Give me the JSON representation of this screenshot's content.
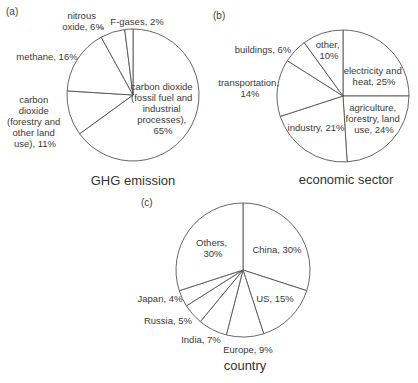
{
  "chart_data": [
    {
      "type": "pie",
      "panel": "(a)",
      "title": "GHG emission",
      "start_angle": "12 o'clock, clockwise",
      "slices": [
        {
          "label": "carbon dioxide (fossil fuel and industrial processes)",
          "value": 65
        },
        {
          "label": "carbon dioxide (forestry and other land use)",
          "value": 11
        },
        {
          "label": "methane",
          "value": 16
        },
        {
          "label": "nitrous oxide",
          "value": 6
        },
        {
          "label": "F-gases",
          "value": 2
        }
      ]
    },
    {
      "type": "pie",
      "panel": "(b)",
      "title": "economic sector",
      "start_angle": "12 o'clock, clockwise",
      "slices": [
        {
          "label": "electricity and heat",
          "value": 25
        },
        {
          "label": "agriculture, forestry, land use",
          "value": 24
        },
        {
          "label": "industry",
          "value": 21
        },
        {
          "label": "transportation",
          "value": 14
        },
        {
          "label": "buildings",
          "value": 6
        },
        {
          "label": "other",
          "value": 10
        }
      ]
    },
    {
      "type": "pie",
      "panel": "(c)",
      "title": "country",
      "start_angle": "12 o'clock, clockwise",
      "slices": [
        {
          "label": "China",
          "value": 30
        },
        {
          "label": "US",
          "value": 15
        },
        {
          "label": "Europe",
          "value": 9
        },
        {
          "label": "India",
          "value": 7
        },
        {
          "label": "Russia",
          "value": 5
        },
        {
          "label": "Japan",
          "value": 4
        },
        {
          "label": "Others",
          "value": 30
        }
      ]
    }
  ],
  "labels": {
    "a": {
      "panel": "(a)",
      "title": "GHG emission",
      "co2_fossil": [
        "carbon dioxide",
        "(fossil fuel and",
        "industrial",
        "processes),",
        "65%"
      ],
      "co2_forest": [
        "carbon",
        "dioxide",
        "(forestry and",
        "other land",
        "use), 11%"
      ],
      "methane": [
        "methane, 16%"
      ],
      "nitrous": [
        "nitrous",
        "oxide, 6%"
      ],
      "fgases": [
        "F-gases, 2%"
      ]
    },
    "b": {
      "panel": "(b)",
      "title": "economic sector",
      "electricity": [
        "electricity and",
        "heat, 25%"
      ],
      "agriculture": [
        "agriculture,",
        "forestry, land",
        "use,  24%"
      ],
      "industry": [
        "industry, 21%"
      ],
      "transportation": [
        "transportation,",
        "14%"
      ],
      "buildings": [
        "buildings, 6%"
      ],
      "other": [
        "other,",
        "10%"
      ]
    },
    "c": {
      "panel": "(c)",
      "title": "country",
      "china": [
        "China, 30%"
      ],
      "us": [
        "US, 15%"
      ],
      "europe": [
        "Europe, 9%"
      ],
      "india": [
        "India, 7%"
      ],
      "russia": [
        "Russia, 5%"
      ],
      "japan": [
        "Japan, 4%"
      ],
      "others": [
        "Others,",
        "30%"
      ]
    }
  }
}
